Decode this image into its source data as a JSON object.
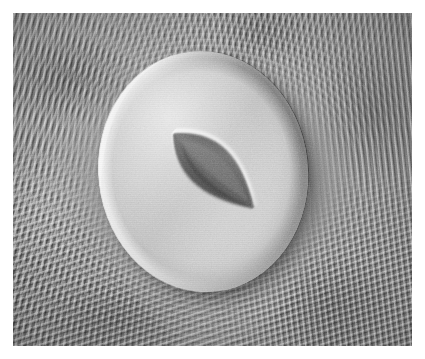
{
  "figure": {
    "kind": "sem-micrograph",
    "modality": "scanning electron micrograph",
    "color_mode": "grayscale",
    "caption": "",
    "width_px": 425,
    "height_px": 359,
    "border": {
      "color": "#ffffff",
      "thickness_px": 13
    }
  },
  "palette": {
    "plate_background": "#8d8d8d",
    "epidermis_mid": "#8f8f8f",
    "epidermis_light": "#c4c4c4",
    "epidermis_dark": "#5f5f5f",
    "guard_cell_bright": "#d6d6d6",
    "guard_cell_mid": "#c3c3c3",
    "guard_cell_shaded": "#a6a6a6",
    "pore_dark": "#4c4c4c",
    "pore_darkest": "#3a3a3a",
    "pore_rim_highlight": "#ebebeb",
    "cast_shadow": "rgba(0,0,0,0.34)"
  },
  "regions": {
    "epidermis": {
      "label": "epidermal cuticle with parallel striations",
      "texture": "fine parallel cuticular ridges flowing around the stomatal complex",
      "striation_bands": [
        {
          "name": "top-left",
          "angle_deg": 112,
          "period_px": 6.3
        },
        {
          "name": "upper-right",
          "angle_deg": 84,
          "period_px": 5.8
        },
        {
          "name": "bottom",
          "angle_deg": 162,
          "period_px": 6.2
        },
        {
          "name": "left-flank",
          "angle_deg": 96,
          "period_px": 6.0
        }
      ]
    },
    "stomatal_complex": {
      "label": "guard cell pair forming a raised elliptical dome",
      "shape": "ellipse",
      "center_pct": {
        "x": 47.8,
        "y": 47.8
      },
      "size_pct": {
        "width": 52.5,
        "height": 72.5
      },
      "rotation_deg": -6,
      "lighting": "specular rim highlight upper-left, cast shadow lower-right"
    },
    "stomatal_pore": {
      "label": "open stomatal pore (aperture) between the guard cells",
      "shape": "lens / pointed ellipse",
      "center_pct": {
        "x": 50.2,
        "y": 47.5
      },
      "length_pct": 34,
      "width_pct": 27.5,
      "rotation_deg": -46,
      "tip_lower_left_px": {
        "x": 157,
        "y": 220
      },
      "tip_upper_right_px": {
        "x": 258,
        "y": 113
      },
      "interior": "dark, graded from near-black at the lower-left lip to mid-gray along the inner ledge"
    }
  },
  "overlays": {
    "grain": {
      "label": "SEM detector grain",
      "opacity": 0.3
    },
    "scanlines": {
      "label": "raster scanline texture",
      "opacity": 0.55
    },
    "vignette": {
      "label": "corner vignette",
      "strength": 0.24
    }
  }
}
